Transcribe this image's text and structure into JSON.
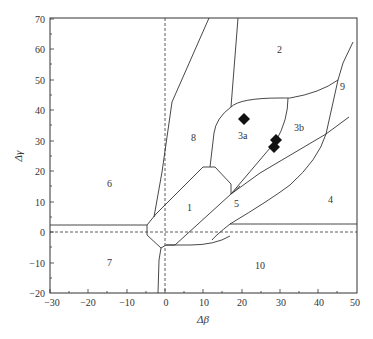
{
  "diagram": {
    "type": "phase-field diagram",
    "xlabel": "Δβ",
    "ylabel": "Δγ",
    "x_ticks": [
      "−30",
      "−20",
      "−10",
      "0",
      "10",
      "20",
      "30",
      "40",
      "50"
    ],
    "y_ticks": [
      "70",
      "60",
      "50",
      "40",
      "30",
      "20",
      "10",
      "0",
      "−10",
      "−20"
    ],
    "xlim": [
      -30,
      50
    ],
    "ylim": [
      -20,
      70
    ],
    "regions": [
      {
        "id": "1",
        "label": "1"
      },
      {
        "id": "2",
        "label": "2"
      },
      {
        "id": "3a",
        "label": "3a"
      },
      {
        "id": "3b",
        "label": "3b"
      },
      {
        "id": "4",
        "label": "4"
      },
      {
        "id": "5",
        "label": "5"
      },
      {
        "id": "6",
        "label": "6"
      },
      {
        "id": "7",
        "label": "7"
      },
      {
        "id": "8",
        "label": "8"
      },
      {
        "id": "9",
        "label": "9"
      },
      {
        "id": "10",
        "label": "10"
      }
    ],
    "data_points": [
      {
        "x": 20.5,
        "y": 28
      },
      {
        "x": 28.5,
        "y": 30
      },
      {
        "x": 28,
        "y": 28
      }
    ],
    "marker": "filled-diamond",
    "line_color": "#333333"
  }
}
